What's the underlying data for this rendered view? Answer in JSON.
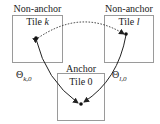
{
  "tiles": [
    {
      "id": "tile-k",
      "heading": "Non-anchor",
      "name": "Tile ",
      "index": "k"
    },
    {
      "id": "tile-l",
      "heading": "Non-anchor",
      "name": "Tile ",
      "index": "l"
    },
    {
      "id": "tile-0",
      "heading": "Anchor",
      "name": "Tile 0",
      "index": ""
    }
  ],
  "arrows": [
    {
      "label_main": "Θ",
      "label_sub": "k,0"
    },
    {
      "label_main": "Θ",
      "label_sub": "l,0"
    }
  ],
  "colors": {
    "box_border": "#9a9a9a",
    "arrow": "#222222"
  }
}
